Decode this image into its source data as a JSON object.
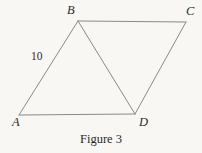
{
  "figure": {
    "caption": "Figure 3",
    "background_color": "#f8f7f4",
    "line_color": "#8a8a8a",
    "text_color": "#2b2b2b",
    "vertices": {
      "A": {
        "label": "A",
        "x": 19,
        "y": 115
      },
      "B": {
        "label": "B",
        "x": 78,
        "y": 21
      },
      "C": {
        "label": "C",
        "x": 186,
        "y": 22
      },
      "D": {
        "label": "D",
        "x": 135,
        "y": 114
      }
    },
    "edges": [
      {
        "name": "AB",
        "from": "A",
        "to": "B"
      },
      {
        "name": "BC",
        "from": "B",
        "to": "C"
      },
      {
        "name": "CD",
        "from": "C",
        "to": "D"
      },
      {
        "name": "DA",
        "from": "D",
        "to": "A"
      },
      {
        "name": "BD",
        "from": "B",
        "to": "D"
      }
    ],
    "measurements": [
      {
        "edge": "AB",
        "value": "10"
      }
    ]
  }
}
